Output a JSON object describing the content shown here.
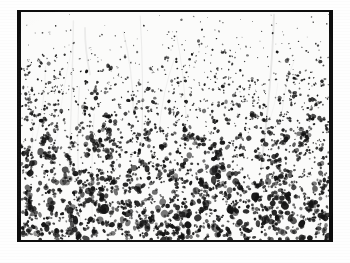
{
  "figure": {
    "kind": "scanned-micrograph",
    "caption": "",
    "label": "",
    "alt_text": "Black and white scanned micrograph showing a dense speckled field of dark stained particles on a light background, enclosed by a dark photographic border",
    "page_background": "#ffffff",
    "plate_border_color": "#0d0d0d",
    "field_background": "#fbfbfa",
    "speck_color": "#141414",
    "plate": {
      "x": 17,
      "y": 10,
      "width": 316,
      "height": 232
    },
    "field": {
      "x": 21,
      "y": 12,
      "width": 308,
      "height": 228
    }
  },
  "chart_data": {
    "type": "heatmap",
    "title": "",
    "subtitle": "",
    "xlabel": "",
    "ylabel": "",
    "legend": [],
    "grid": false,
    "annotations": [],
    "value_label": "speck coverage (fraction of area dark)",
    "x": [
      0.0,
      0.1,
      0.2,
      0.3,
      0.4,
      0.5,
      0.6,
      0.7,
      0.8,
      0.9,
      1.0
    ],
    "xlim": [
      0,
      1
    ],
    "ylim": [
      0,
      1
    ],
    "density_profile": {
      "axis": "depth (top = 0, bottom = 1)",
      "y": [
        0.0,
        0.1,
        0.2,
        0.3,
        0.4,
        0.5,
        0.6,
        0.7,
        0.8,
        0.9,
        1.0
      ],
      "values": [
        0.04,
        0.1,
        0.2,
        0.29,
        0.34,
        0.37,
        0.39,
        0.41,
        0.44,
        0.47,
        0.45
      ]
    },
    "size_profile": {
      "axis": "depth (top = 0, bottom = 1)",
      "y": [
        0.0,
        0.25,
        0.5,
        0.75,
        1.0
      ],
      "values": [
        1.0,
        1.6,
        2.2,
        2.9,
        3.4
      ],
      "units": "relative speck diameter (px)"
    },
    "series": [
      {
        "name": "speck density",
        "values": [
          0.04,
          0.1,
          0.2,
          0.29,
          0.34,
          0.37,
          0.39,
          0.41,
          0.44,
          0.47,
          0.45
        ]
      },
      {
        "name": "speck size",
        "values": [
          1.0,
          1.2,
          1.5,
          1.8,
          2.0,
          2.2,
          2.5,
          2.7,
          2.9,
          3.2,
          3.4
        ]
      }
    ],
    "streaks": {
      "count": 14,
      "orientation": "near-vertical, slightly diagonal",
      "color": "#9a9a9a"
    },
    "total_specks": 3100
  }
}
